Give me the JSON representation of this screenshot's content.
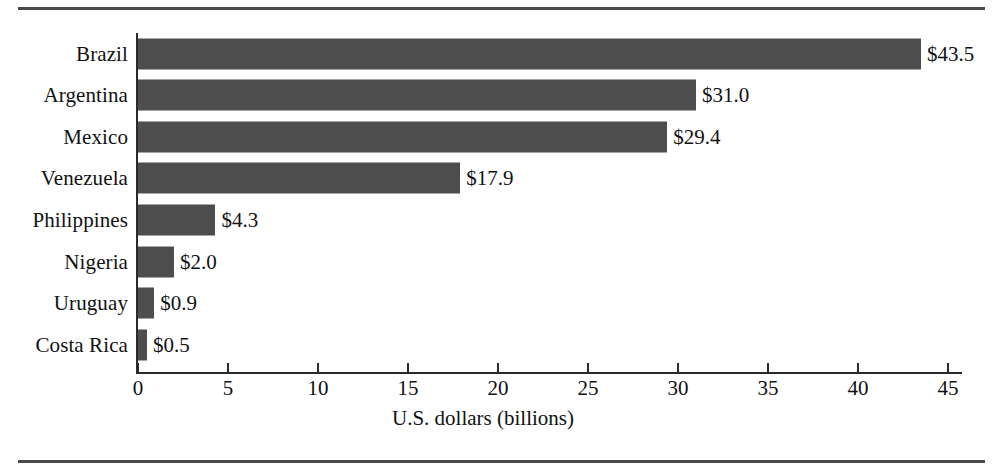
{
  "chart_data": {
    "type": "bar",
    "orientation": "horizontal",
    "title": "",
    "subtitle": "",
    "xlabel": "U.S. dollars (billions)",
    "ylabel": "",
    "categories": [
      "Brazil",
      "Argentina",
      "Mexico",
      "Venezuela",
      "Philippines",
      "Nigeria",
      "Uruguay",
      "Costa Rica"
    ],
    "values": [
      43.5,
      31.0,
      29.4,
      17.9,
      4.3,
      2.0,
      0.9,
      0.5
    ],
    "value_labels": [
      "$43.5",
      "$31.0",
      "$29.4",
      "$17.9",
      "$4.3",
      "$2.0",
      "$0.9",
      "$0.5"
    ],
    "xlim": [
      0,
      45
    ],
    "xticks": [
      0,
      5,
      10,
      15,
      20,
      25,
      30,
      35,
      40,
      45
    ],
    "xtick_labels": [
      "0",
      "5",
      "10",
      "15",
      "20",
      "25",
      "30",
      "35",
      "40",
      "45"
    ],
    "grid": false,
    "legend": false,
    "bar_color": "#4d4d4d",
    "axis_color": "#2b2b2b",
    "background_color": "#ffffff",
    "rule_color": "#4a4a4a"
  }
}
